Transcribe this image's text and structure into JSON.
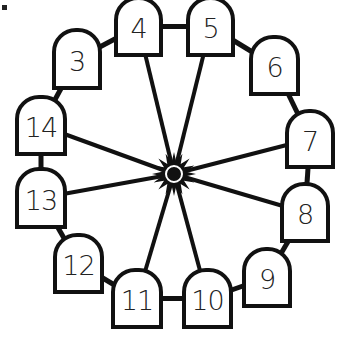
{
  "diagram": {
    "type": "ferris-wheel",
    "hub": {
      "cx": 174,
      "cy": 174,
      "color": "#111111"
    },
    "stroke_color": "#111111",
    "gondolas": [
      {
        "label": "3",
        "x": 52,
        "y": 28,
        "w": 50,
        "h": 62
      },
      {
        "label": "4",
        "x": 114,
        "y": -4,
        "w": 49,
        "h": 61
      },
      {
        "label": "5",
        "x": 186,
        "y": -4,
        "w": 49,
        "h": 61
      },
      {
        "label": "6",
        "x": 249,
        "y": 35,
        "w": 51,
        "h": 61
      },
      {
        "label": "7",
        "x": 285,
        "y": 109,
        "w": 50,
        "h": 60
      },
      {
        "label": "8",
        "x": 280,
        "y": 182,
        "w": 50,
        "h": 61
      },
      {
        "label": "9",
        "x": 242,
        "y": 247,
        "w": 50,
        "h": 61
      },
      {
        "label": "10",
        "x": 182,
        "y": 268,
        "w": 51,
        "h": 61
      },
      {
        "label": "11",
        "x": 111,
        "y": 268,
        "w": 52,
        "h": 61
      },
      {
        "label": "12",
        "x": 53,
        "y": 233,
        "w": 51,
        "h": 61
      },
      {
        "label": "13",
        "x": 15,
        "y": 167,
        "w": 52,
        "h": 62
      },
      {
        "label": "14",
        "x": 15,
        "y": 95,
        "w": 52,
        "h": 61
      }
    ],
    "spokes_to": [
      "4",
      "5",
      "7",
      "8",
      "10",
      "11",
      "13",
      "14"
    ]
  }
}
